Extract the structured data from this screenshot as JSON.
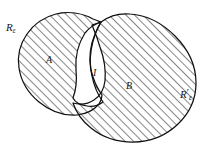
{
  "figure": {
    "kind": "set-region-diagram",
    "background_color": "#ffffff",
    "outline_color": "#101010",
    "hatch_color": "#303030",
    "width": 208,
    "height": 154
  },
  "labels": {
    "region_left": {
      "base": "R",
      "sub": "ε",
      "prime": ""
    },
    "region_right": {
      "base": "R",
      "sub": "ε",
      "prime": "′"
    },
    "set_a": "A",
    "set_b": "B",
    "intersection": "I"
  },
  "regions": [
    {
      "name": "left-region",
      "label": "A",
      "outer_label": "Rε",
      "fill": "hatched",
      "hatch_angle_deg": 45
    },
    {
      "name": "right-region",
      "label": "B",
      "outer_label": "R′ε",
      "fill": "hatched",
      "hatch_angle_deg": 45
    },
    {
      "name": "intersection-region",
      "label": "I",
      "outer_label": "",
      "fill": "white",
      "hatch_angle_deg": 0
    }
  ]
}
